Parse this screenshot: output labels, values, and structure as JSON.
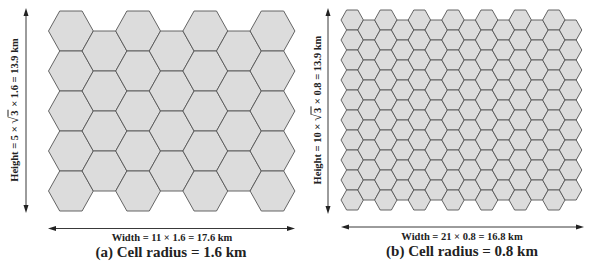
{
  "colors": {
    "background": "#ffffff",
    "hex_fill": "#dcdcdc",
    "hex_stroke": "#555555",
    "annotation": "#222222"
  },
  "panels": [
    {
      "id": "a",
      "cell_radius_km": 1.6,
      "grid": {
        "columns": 7,
        "rows_even_column": 5,
        "rows_odd_column": 4,
        "hex_radius_px": 22.4,
        "hex_height_px": 40,
        "origin_x": 48.5,
        "origin_y": 11
      },
      "height_label": {
        "prefix": "Height = 5 × ",
        "radicand": "3",
        "suffix": " × 1.6 = 13.9 km"
      },
      "width_label": "Width = 11 × 1.6 = 17.6 km",
      "caption": "(a) Cell radius = 1.6 km"
    },
    {
      "id": "b",
      "cell_radius_km": 0.8,
      "grid": {
        "columns": 14,
        "rows_even_column": 10,
        "rows_odd_column": 9,
        "hex_radius_px": 11.2,
        "hex_height_px": 20,
        "origin_x": 341,
        "origin_y": 10
      },
      "height_label": {
        "prefix": "Height = 10 × ",
        "radicand": "3",
        "suffix": " × 0.8 = 13.9 km"
      },
      "width_label": "Width = 21 × 0.8 = 16.8 km",
      "caption": "(b) Cell radius = 0.8 km"
    }
  ]
}
